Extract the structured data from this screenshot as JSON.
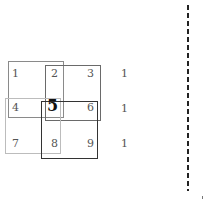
{
  "diagram": {
    "grid": [
      {
        "label": "1",
        "x": 12,
        "y": 68
      },
      {
        "label": "2",
        "x": 51,
        "y": 68
      },
      {
        "label": "3",
        "x": 87,
        "y": 68
      },
      {
        "label": "4",
        "x": 12,
        "y": 102
      },
      {
        "label": "5",
        "x": 47,
        "y": 98,
        "emphasis": true
      },
      {
        "label": "6",
        "x": 87,
        "y": 102
      },
      {
        "label": "7",
        "x": 12,
        "y": 138
      },
      {
        "label": "8",
        "x": 51,
        "y": 138
      },
      {
        "label": "9",
        "x": 87,
        "y": 138
      }
    ],
    "side_values": [
      {
        "label": "1",
        "x": 121,
        "y": 68
      },
      {
        "label": "1",
        "x": 121,
        "y": 103
      },
      {
        "label": "1",
        "x": 121,
        "y": 138
      }
    ],
    "boxes": [
      {
        "name": "box-top-left",
        "x": 8,
        "y": 61,
        "w": 56,
        "h": 57,
        "color": "#8a8a8a"
      },
      {
        "name": "box-top-right",
        "x": 45,
        "y": 65,
        "w": 56,
        "h": 56,
        "color": "#6a6a6a"
      },
      {
        "name": "box-bottom-left",
        "x": 5,
        "y": 98,
        "w": 56,
        "h": 56,
        "color": "#bcbcbc"
      },
      {
        "name": "box-bottom-right",
        "x": 41,
        "y": 101,
        "w": 57,
        "h": 58,
        "color": "#333333"
      }
    ]
  }
}
